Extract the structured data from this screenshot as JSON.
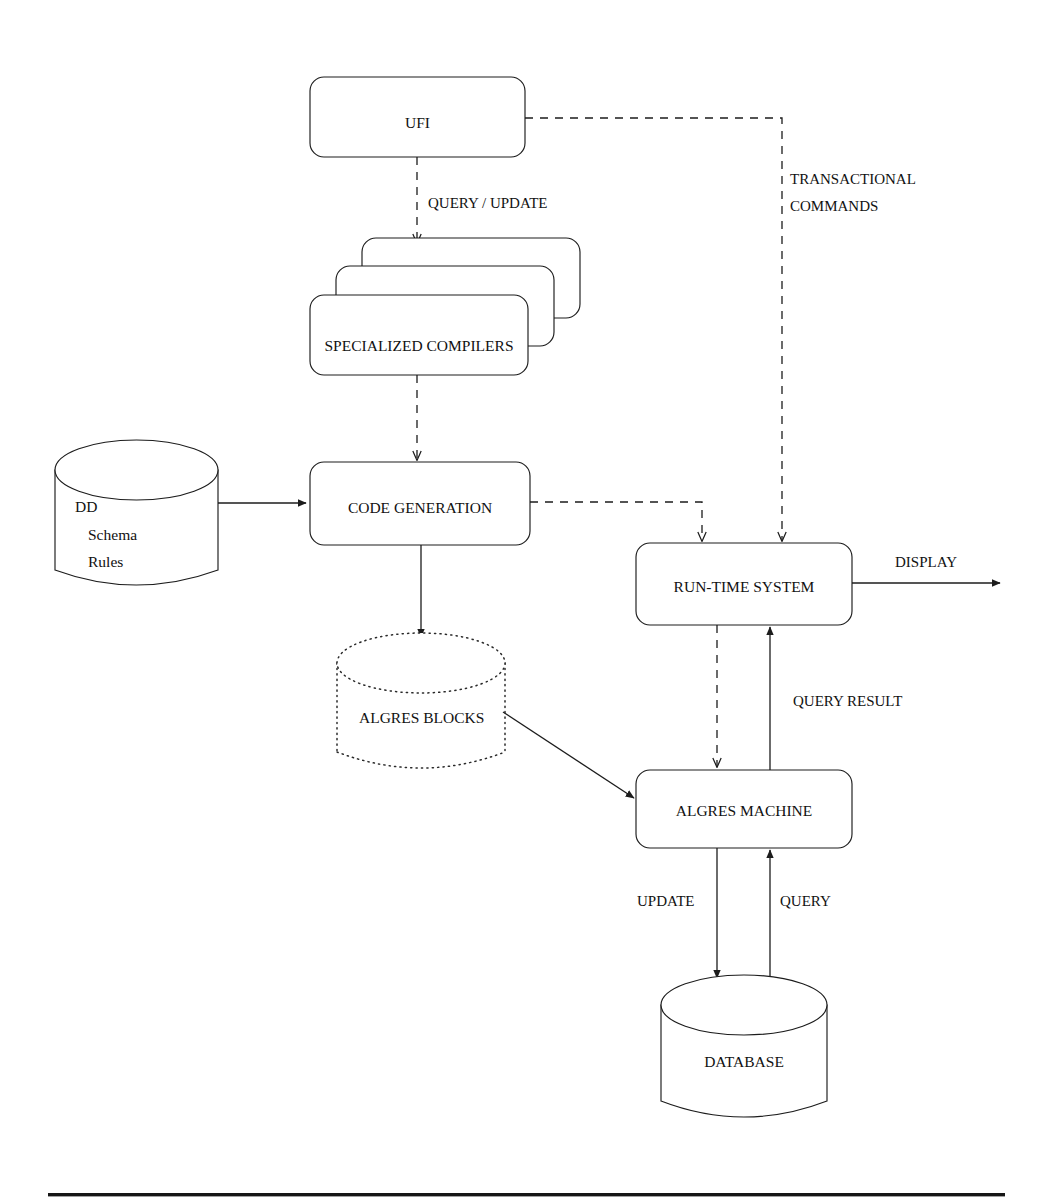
{
  "diagram": {
    "type": "system-architecture-flow",
    "nodes": [
      {
        "id": "ufi",
        "label": "UFI",
        "shape": "rounded-rectangle"
      },
      {
        "id": "specialized-compilers",
        "label": "SPECIALIZED COMPILERS",
        "shape": "stacked-rounded-rectangle",
        "stack_count": 3
      },
      {
        "id": "code-generation",
        "label": "CODE GENERATION",
        "shape": "rounded-rectangle"
      },
      {
        "id": "run-time-system",
        "label": "RUN-TIME SYSTEM",
        "shape": "rounded-rectangle"
      },
      {
        "id": "algres-machine",
        "label": "ALGRES MACHINE",
        "shape": "rounded-rectangle"
      },
      {
        "id": "dd-store",
        "label_lines": [
          "DD",
          "Schema",
          "Rules"
        ],
        "shape": "cylinder",
        "style": "solid"
      },
      {
        "id": "algres-blocks",
        "label": "ALGRES BLOCKS",
        "shape": "cylinder",
        "style": "dotted"
      },
      {
        "id": "database",
        "label": "DATABASE",
        "shape": "cylinder",
        "style": "solid"
      }
    ],
    "edges": [
      {
        "id": "ufi-to-compilers",
        "label": "QUERY / UPDATE",
        "style": "dashed",
        "from": "ufi",
        "to": "specialized-compilers"
      },
      {
        "id": "ufi-to-runtime",
        "label_lines": [
          "TRANSACTIONAL",
          "COMMANDS"
        ],
        "style": "dashed",
        "from": "ufi",
        "to": "run-time-system"
      },
      {
        "id": "compilers-to-codegen",
        "label": "",
        "style": "dashed",
        "from": "specialized-compilers",
        "to": "code-generation"
      },
      {
        "id": "dd-to-codegen",
        "label": "",
        "style": "solid",
        "from": "dd-store",
        "to": "code-generation"
      },
      {
        "id": "codegen-to-blocks",
        "label": "",
        "style": "solid",
        "from": "code-generation",
        "to": "algres-blocks"
      },
      {
        "id": "codegen-to-runtime",
        "label": "",
        "style": "dashed",
        "from": "code-generation",
        "to": "run-time-system"
      },
      {
        "id": "runtime-to-display",
        "label": "DISPLAY",
        "style": "solid",
        "from": "run-time-system",
        "to": "display-output"
      },
      {
        "id": "runtime-to-machine",
        "label": "",
        "style": "dashed",
        "from": "run-time-system",
        "to": "algres-machine"
      },
      {
        "id": "machine-to-runtime",
        "label": "QUERY RESULT",
        "style": "solid",
        "from": "algres-machine",
        "to": "run-time-system"
      },
      {
        "id": "blocks-to-machine",
        "label": "",
        "style": "solid",
        "from": "algres-blocks",
        "to": "algres-machine"
      },
      {
        "id": "machine-to-database",
        "label": "UPDATE",
        "style": "solid",
        "from": "algres-machine",
        "to": "database"
      },
      {
        "id": "database-to-machine",
        "label": "QUERY",
        "style": "solid",
        "from": "database",
        "to": "algres-machine"
      }
    ],
    "labels": {
      "ufi": "UFI",
      "specialized_compilers": "SPECIALIZED COMPILERS",
      "code_generation": "CODE GENERATION",
      "run_time_system": "RUN-TIME SYSTEM",
      "algres_machine": "ALGRES MACHINE",
      "algres_blocks": "ALGRES BLOCKS",
      "database": "DATABASE",
      "dd": "DD",
      "schema": "Schema",
      "rules": "Rules",
      "query_update": "QUERY / UPDATE",
      "transactional": "TRANSACTIONAL",
      "commands": "COMMANDS",
      "display": "DISPLAY",
      "query_result": "QUERY RESULT",
      "update": "UPDATE",
      "query": "QUERY"
    },
    "colors": {
      "stroke": "#1c1c1c",
      "background": "#ffffff",
      "text": "#111111",
      "footer_rule": "#161616"
    }
  }
}
